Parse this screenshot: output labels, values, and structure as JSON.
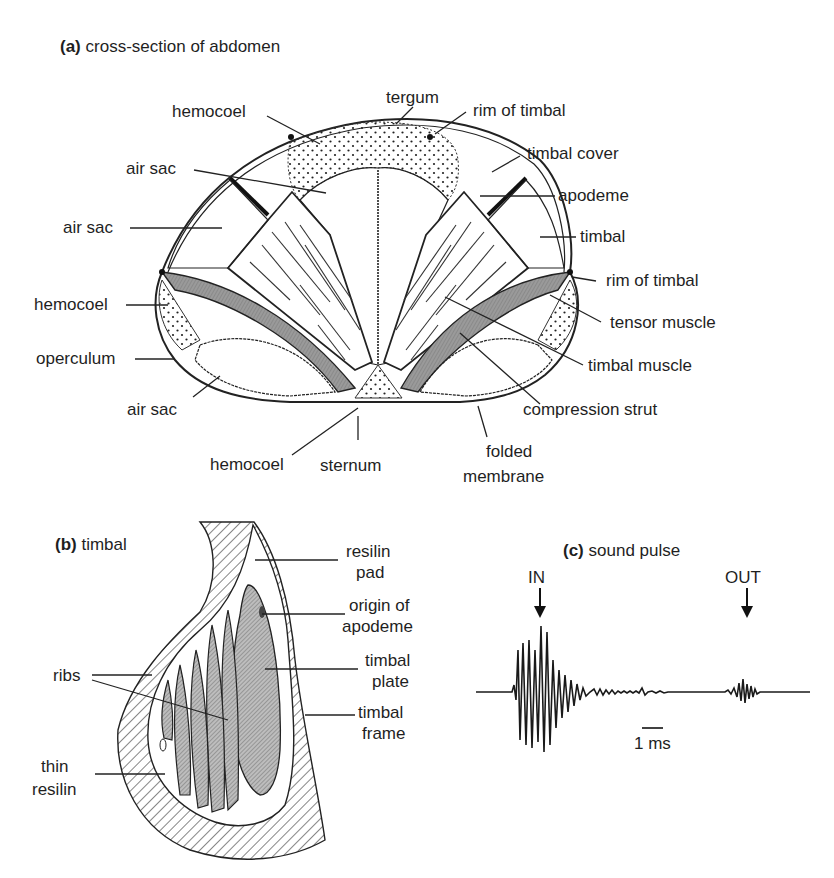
{
  "panel_a": {
    "letter": "(a)",
    "title": "cross-section of abdomen",
    "labels": {
      "tergum": "tergum",
      "hemocoel_top": "hemocoel",
      "rim_of_timbal_top": "rim of timbal",
      "air_sac_top": "air sac",
      "timbal_cover": "timbal cover",
      "apodeme": "apodeme",
      "air_sac_left": "air sac",
      "timbal": "timbal",
      "rim_of_timbal_right": "rim of timbal",
      "hemocoel_left": "hemocoel",
      "tensor_muscle": "tensor muscle",
      "operculum": "operculum",
      "timbal_muscle": "timbal muscle",
      "air_sac_bottom": "air sac",
      "compression_strut": "compression strut",
      "hemocoel_bottom": "hemocoel",
      "sternum": "sternum",
      "folded_membrane_1": "folded",
      "folded_membrane_2": "membrane"
    }
  },
  "panel_b": {
    "letter": "(b)",
    "title": "timbal",
    "labels": {
      "resilin_pad_1": "resilin",
      "resilin_pad_2": "pad",
      "origin_apodeme_1": "origin of",
      "origin_apodeme_2": "apodeme",
      "timbal_plate_1": "timbal",
      "timbal_plate_2": "plate",
      "ribs": "ribs",
      "timbal_frame_1": "timbal",
      "timbal_frame_2": "frame",
      "thin_resilin_1": "thin",
      "thin_resilin_2": "resilin"
    }
  },
  "panel_c": {
    "letter": "(c)",
    "title": "sound pulse",
    "in_label": "IN",
    "out_label": "OUT",
    "scale_label": "1 ms"
  },
  "colors": {
    "ink": "#1f1f1f",
    "muscle_fill": "#8c8c8c",
    "background": "#ffffff"
  }
}
